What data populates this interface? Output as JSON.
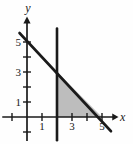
{
  "figure": {
    "background": "#fefefe",
    "ink": "#1a1a1a",
    "shade": "#bdbdbd"
  },
  "chart_data": {
    "type": "line",
    "title": "",
    "xlabel": "x",
    "ylabel": "y",
    "xlim": [
      -1.7,
      6.2
    ],
    "ylim": [
      -1.7,
      6.8
    ],
    "grid": false,
    "legend": false,
    "axes": {
      "x": {
        "label": "x",
        "from": -1.65,
        "to": 5.75,
        "arrow_to": 6.1,
        "ticks": [
          -1,
          1,
          2,
          3,
          4,
          5
        ],
        "labeled_ticks": [
          1,
          3,
          5
        ]
      },
      "y": {
        "label": "y",
        "from": -1.6,
        "to": 6.3,
        "arrow_to": 6.7,
        "ticks": [
          -1,
          1,
          2,
          3,
          4,
          5
        ],
        "labeled_ticks": [
          1,
          3,
          5
        ]
      }
    },
    "series": [
      {
        "name": "boundary-line-x-plus-y-equals-5",
        "points": [
          [
            -0.5,
            5.6
          ],
          [
            5.6,
            -0.95
          ]
        ],
        "intercepts": [
          [
            0,
            5
          ],
          [
            5,
            0
          ]
        ]
      },
      {
        "name": "vertical-line-x-equals-2",
        "points": [
          [
            2,
            5.9
          ],
          [
            2,
            -1.55
          ]
        ]
      }
    ],
    "shaded_region": {
      "name": "feasible-region",
      "vertices": [
        [
          2,
          0
        ],
        [
          2,
          3
        ],
        [
          5,
          0
        ]
      ],
      "fill": "#bdbdbd"
    }
  }
}
